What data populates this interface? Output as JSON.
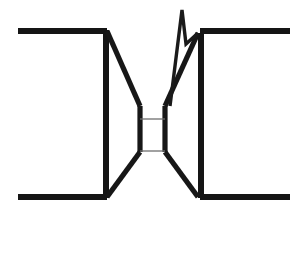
{
  "figure": {
    "kind": "line-drawing",
    "background_color": "#ffffff",
    "line_color": "#151515",
    "thin_line_color": "#6e6e6e",
    "canvas": {
      "width": 305,
      "height": 255
    },
    "parts": {
      "top_left_flange": "top-left-flange",
      "bottom_left_flange": "bottom-left-flange",
      "top_right_flange": "top-right-flange",
      "bottom_right_flange": "bottom-right-flange",
      "left_vertical_wall": "left-vertical-wall",
      "right_vertical_wall": "right-vertical-wall",
      "left_upper_taper": "left-upper-taper",
      "left_lower_taper": "left-lower-taper",
      "right_upper_taper": "right-upper-taper",
      "right_lower_taper": "right-lower-taper",
      "throat_left_wall": "throat-left-wall",
      "throat_right_wall": "throat-right-wall",
      "throat_upper_crossline": "throat-upper-crossline",
      "throat_lower_crossline": "throat-lower-crossline",
      "spike": "needle-spike"
    },
    "geometry": {
      "top_left_flange": "M 18 31 L 107 31",
      "bottom_left_flange": "M 18 197 L 107 197",
      "top_right_flange": "M 200 31 L 290 31",
      "bottom_right_flange": "M 200 197 L 290 197",
      "left_vertical_wall": "M 106 30 L 106 198",
      "right_vertical_wall": "M 201 33 L 201 198",
      "left_upper_taper": "M 107 31 L 140 106",
      "left_lower_taper": "M 140 152 L 107 197",
      "right_upper_taper": "M 198 33 L 165 106",
      "right_lower_taper": "M 165 152 L 198 197",
      "throat_left_wall": "M 140 106 L 140 152",
      "throat_right_wall": "M 165 106 L 165 152",
      "throat_upper_crossline": "M 140 119 L 165 119",
      "throat_lower_crossline": "M 140 151 L 165 151",
      "spike": "M 170 106 L 182 10 L 186 44 L 198 33"
    }
  }
}
